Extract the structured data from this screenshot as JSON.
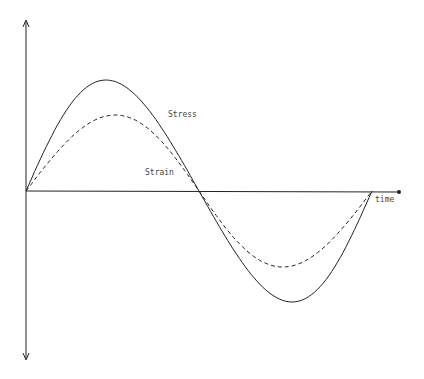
{
  "chart_data": {
    "type": "line",
    "title": "",
    "xlabel": "time",
    "ylabel": "",
    "grid": false,
    "series": [
      {
        "name": "Stress",
        "style": "solid",
        "amplitude": 1.0,
        "phase": "leads"
      },
      {
        "name": "Strain",
        "style": "dashed",
        "amplitude": 0.66,
        "phase": "lags"
      }
    ],
    "annotations": [
      "Stress",
      "Strain",
      "time"
    ]
  },
  "labels": {
    "stress": "Stress",
    "strain": "Strain",
    "time": "time"
  },
  "colors": {
    "line": "#222222",
    "text": "#444444"
  }
}
